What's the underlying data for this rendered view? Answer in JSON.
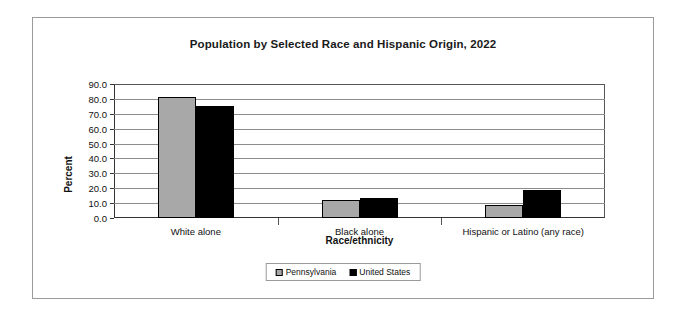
{
  "chart_data": {
    "type": "bar",
    "title": "Population by Selected Race and Hispanic Origin, 2022",
    "xlabel": "Race/ethnicity",
    "ylabel": "Percent",
    "categories": [
      "White alone",
      "Black alone",
      "Hispanic or Latino (any race)"
    ],
    "series": [
      {
        "name": "Pennsylvania",
        "color": "#a8a8a8",
        "values": [
          81.2,
          12.4,
          8.6
        ]
      },
      {
        "name": "United States",
        "color": "#000000",
        "values": [
          75.5,
          13.6,
          19.1
        ]
      }
    ],
    "ylim": [
      0,
      90
    ],
    "ytick_step": 10,
    "ytick_labels": [
      "90.0",
      "80.0",
      "70.0",
      "60.0",
      "50.0",
      "40.0",
      "30.0",
      "20.0",
      "10.0",
      "0.0"
    ],
    "grid": true,
    "legend_position": "bottom"
  }
}
